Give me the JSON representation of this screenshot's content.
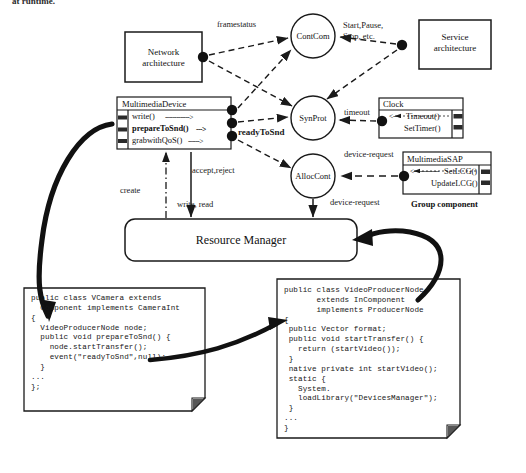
{
  "page": {
    "clipped_heading": "at runtime."
  },
  "components": {
    "network_architecture": {
      "label": "Network\narchitecture"
    },
    "service_architecture": {
      "label": "Service\narchitecture"
    },
    "resource_manager": {
      "label": "Resource Manager"
    }
  },
  "interfaces": {
    "multimedia_device": {
      "title": "MultimediaDevice",
      "operations": [
        {
          "name": "write()",
          "arrow": "------------->",
          "bold": false
        },
        {
          "name": "prepareToSnd()",
          "arrow": "--->",
          "bold": true
        },
        {
          "name": "grabwithQoS()",
          "arrow": "------>",
          "bold": false
        }
      ]
    },
    "clock": {
      "title": "Clock",
      "operations": [
        {
          "name": "Timeout()",
          "arrow": "<---",
          "bold": false
        },
        {
          "name": "SetTimer()",
          "arrow": "",
          "bold": false
        }
      ]
    },
    "multimedia_sap": {
      "title": "MultimediaSAP",
      "operations": [
        {
          "name": "SetLCG()",
          "arrow": "<---------------",
          "bold": false
        },
        {
          "name": "UpdateLCG()",
          "arrow": "",
          "bold": false
        }
      ]
    },
    "group_component_label": "Group component"
  },
  "connectors": {
    "cont_com": "ContCom",
    "syn_prot": "SynProt",
    "alloc_cont": "AllocCont"
  },
  "edge_labels": {
    "framestatus": "framestatus",
    "start_pause_stop": "Start,Pause,\nStop, etc.",
    "ready_to_snd": "readyToSnd",
    "timeout": "timeout",
    "accept_reject": "accept,reject",
    "device_request_top": "device-request",
    "device_request_bottom": "device-request",
    "create": "create",
    "write_read": "write, read"
  },
  "code_notes": {
    "left": {
      "lines": "public class VCamera extends\n  Component implements CameraInt\n{\n  VideoProducerNode node;\n  public void prepareToSnd() {\n    node.startTransfer();\n    event(\"readyToSnd\",null);\n  }\n...\n};"
    },
    "right": {
      "lines": "public class VideoProducerNode\n       extends InComponent\n       implements ProducerNode\n{\n public Vector format;\n public void startTransfer() {\n   return (startVideo());\n }\n native private int startVideo();\n static {\n   System.\n   loadLibrary(\"DevicesManager\");\n }\n...\n}"
    }
  },
  "colors": {
    "ink": "#111111",
    "paper": "#ffffff",
    "line": "#1a1a1a"
  }
}
